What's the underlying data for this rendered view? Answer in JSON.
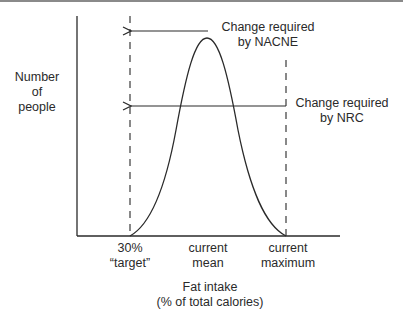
{
  "diagram": {
    "y_axis_label": [
      "Number",
      "of",
      "people"
    ],
    "x_axis_title": [
      "Fat intake",
      "(% of total calories)"
    ],
    "x_ticks": [
      {
        "lines": [
          "30%",
          "“target”"
        ]
      },
      {
        "lines": [
          "current",
          "mean"
        ]
      },
      {
        "lines": [
          "current",
          "maximum"
        ]
      }
    ],
    "annotations": [
      {
        "lines": [
          "Change required",
          "by NACNE"
        ]
      },
      {
        "lines": [
          "Change required",
          "by NRC"
        ]
      }
    ],
    "curve": "bell-shaped distribution",
    "colors": {
      "line": "#2a2a2a",
      "dashed": "#3a3a3a",
      "rule": "#8a8a8a"
    }
  }
}
